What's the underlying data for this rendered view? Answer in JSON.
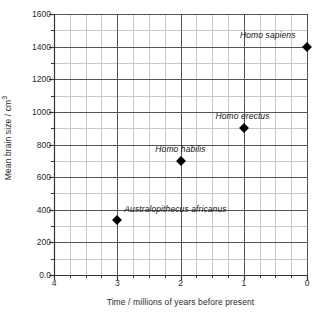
{
  "chart_data": {
    "type": "scatter",
    "title": "",
    "xlabel": "Time / millions of years before present",
    "ylabel": "Mean brain size / cm",
    "ylabel_superscript": "3",
    "xlim": [
      4,
      0
    ],
    "ylim": [
      0,
      1600
    ],
    "x_ticks": [
      "4",
      "3",
      "2",
      "1",
      "0"
    ],
    "x_tick_values": [
      4,
      3,
      2,
      1,
      0
    ],
    "y_ticks": [
      "0.0",
      "200",
      "400",
      "600",
      "800",
      "1000",
      "1200",
      "1400",
      "1600"
    ],
    "y_tick_values": [
      0,
      200,
      400,
      600,
      800,
      1000,
      1200,
      1400,
      1600
    ],
    "x_minor_step": 0.25,
    "y_minor_step": 100,
    "grid": true,
    "grid_major_color": "#555555",
    "grid_minor_color": "#c8c8c8",
    "axis_color": "#333333",
    "marker_color": "#000000",
    "marker_shape": "diamond",
    "legend": "none",
    "points": [
      {
        "label": "Australopithecus africanus",
        "x": 3,
        "y": 340,
        "label_dx": -0.92,
        "label_dy": 62
      },
      {
        "label": "Homo habilis",
        "x": 2,
        "y": 700,
        "label_dx": 0.0,
        "label_dy": 70
      },
      {
        "label": "Homo erectus",
        "x": 1,
        "y": 900,
        "label_dx": 0.02,
        "label_dy": 72
      },
      {
        "label": "Homo sapiens",
        "x": 0,
        "y": 1400,
        "label_dx": 0.62,
        "label_dy": 72
      }
    ]
  }
}
